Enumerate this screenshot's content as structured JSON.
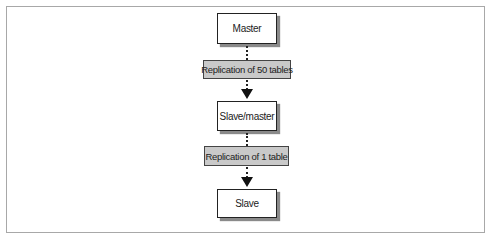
{
  "diagram": {
    "type": "flowchart",
    "nodes": [
      {
        "id": "master",
        "label": "Master"
      },
      {
        "id": "slave_master",
        "label": "Slave/master"
      },
      {
        "id": "slave",
        "label": "Slave"
      }
    ],
    "edges": [
      {
        "from": "master",
        "to": "slave_master",
        "label": "Replication of 50 tables",
        "style": "dotted-arrow"
      },
      {
        "from": "slave_master",
        "to": "slave",
        "label": "Replication of 1 table",
        "style": "dotted-arrow"
      }
    ],
    "colors": {
      "node_fill": "#ffffff",
      "node_border": "#222222",
      "label_fill": "#c9c9c9",
      "shadow": "#8a8a8a",
      "frame_border": "#a8a8a8"
    }
  }
}
